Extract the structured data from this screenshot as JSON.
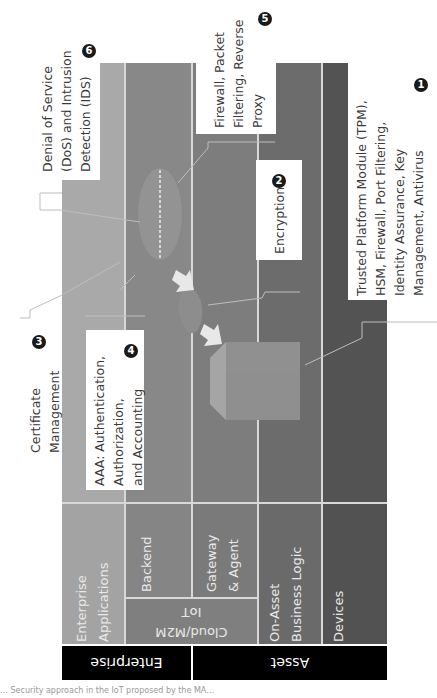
{
  "diagram": {
    "orientation": "rotated -90deg",
    "bands": [
      {
        "label": "Enterprise"
      },
      {
        "label": "Asset"
      }
    ],
    "layers": [
      {
        "label": "Enterprise Applications",
        "color": "#a8a8a8"
      },
      {
        "label": "Backend",
        "color": "#8a8a8a"
      },
      {
        "label": "Gateway & Agent",
        "color": "#7e7e7e"
      },
      {
        "label": "On-Asset Business Logic",
        "color": "#6e6e6e"
      },
      {
        "label": "Devices",
        "color": "#555555"
      }
    ],
    "group_label": "IoT Cloud/M2M",
    "callouts": [
      {
        "number": "1",
        "text": "Trusted Platform Module (TPM), HSM, Firewall, Port Filtering, Identity Assurance, Key Management, Antivirus"
      },
      {
        "number": "2",
        "text": "Encryption"
      },
      {
        "number": "3",
        "text": "Certificate Management"
      },
      {
        "number": "4",
        "text": "AAA: Authentication, Authorization, and Accounting"
      },
      {
        "number": "5",
        "text": "Firewall, Packet Filtering, Reverse Proxy"
      },
      {
        "number": "6",
        "text": "Denial of Service (DoS) and Intrusion Detection (IDS)"
      }
    ],
    "caption": "… Security approach in the IoT proposed by the MA…"
  },
  "labels": {
    "band_enterprise": "Enterprise",
    "band_asset": "Asset",
    "enterprise_apps_1": "Enterprise",
    "enterprise_apps_2": "Applications",
    "backend": "Backend",
    "gateway_1": "Gateway",
    "gateway_2": "& Agent",
    "iot_1": "IoT",
    "iot_2": "Cloud/M2M",
    "onasset_1": "On-Asset",
    "onasset_2": "Business Logic",
    "devices": "Devices",
    "c1_l1": "Trusted Platform Module (TPM),",
    "c1_l2": "HSM, Firewall, Port Filtering,",
    "c1_l3": "Identity Assurance, Key",
    "c1_l4": "Management, Antivirus",
    "c1_num": "1",
    "c2_l1": "Encryption",
    "c2_num": "2",
    "c3_l1": "Certificate",
    "c3_l2": "Management",
    "c3_num": "3",
    "c4_l1": "AAA: Authentication,",
    "c4_l2": "Authorization,",
    "c4_l3": "and Accounting",
    "c4_num": "4",
    "c5_l1": "Firewall, Packet",
    "c5_l2": "Filtering, Reverse",
    "c5_l3": "Proxy",
    "c5_num": "5",
    "c6_l1": "Denial of Service",
    "c6_l2": "(DoS) and Intrusion",
    "c6_l3": "Detection (IDS)",
    "c6_num": "6",
    "caption": "… Security approach in the IoT proposed by the MA…"
  }
}
